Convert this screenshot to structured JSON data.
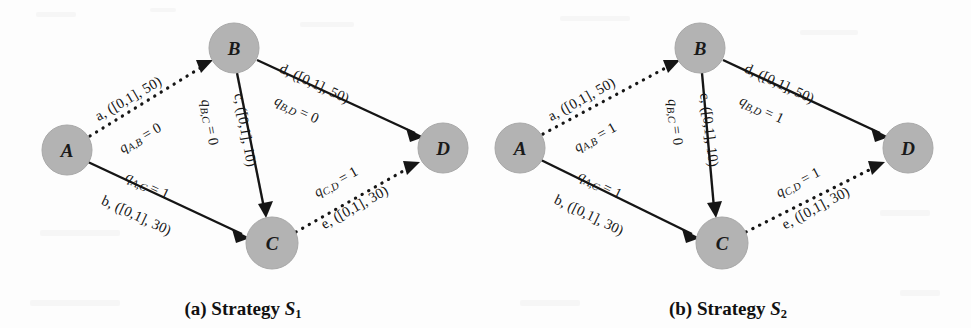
{
  "figure": {
    "type": "two-panel-directed-graph-figure",
    "node_fill_color": "#b3b3b3",
    "edge_color": "#151515",
    "background_color": "#fdfdfd"
  },
  "panels": [
    {
      "id": "panel-a",
      "caption_prefix": "(a)",
      "caption_word": "Strategy",
      "caption_symbol": "S",
      "caption_subscript": "1",
      "caption_full": "(a) Strategy S1",
      "nodes": [
        {
          "id": "A",
          "label": "A",
          "cx": 67,
          "cy": 150,
          "r": 25
        },
        {
          "id": "B",
          "label": "B",
          "cx": 234,
          "cy": 48,
          "r": 25
        },
        {
          "id": "C",
          "label": "C",
          "cx": 272,
          "cy": 243,
          "r": 26
        },
        {
          "id": "D",
          "label": "D",
          "cx": 443,
          "cy": 148,
          "r": 25
        }
      ],
      "edges": [
        {
          "id": "A-B",
          "from": "A",
          "to": "B",
          "style": "dotted",
          "edge_id": "a",
          "capacity_label": "a, ([0,1], 50)",
          "flow_var": "q",
          "flow_sub": "A,B",
          "flow_value": "0",
          "flow_label": "qA,B = 0"
        },
        {
          "id": "A-C",
          "from": "A",
          "to": "C",
          "style": "solid",
          "edge_id": "b",
          "capacity_label": "b, ([0,1], 30)",
          "flow_var": "q",
          "flow_sub": "A,C",
          "flow_value": "1",
          "flow_label": "qA,C = 1"
        },
        {
          "id": "B-C",
          "from": "B",
          "to": "C",
          "style": "solid",
          "edge_id": "c",
          "capacity_label": "c, ([0,1], 10)",
          "flow_var": "q",
          "flow_sub": "B,C",
          "flow_value": "0",
          "flow_label": "qB,C = 0"
        },
        {
          "id": "B-D",
          "from": "B",
          "to": "D",
          "style": "solid",
          "edge_id": "d",
          "capacity_label": "d, ([0,1], 50)",
          "flow_var": "q",
          "flow_sub": "B,D",
          "flow_value": "0",
          "flow_label": "qB,D = 0"
        },
        {
          "id": "C-D",
          "from": "C",
          "to": "D",
          "style": "dotted",
          "edge_id": "e",
          "capacity_label": "e, ([0,1], 30)",
          "flow_var": "q",
          "flow_sub": "C,D",
          "flow_value": "1",
          "flow_label": "qC,D = 1"
        }
      ]
    },
    {
      "id": "panel-b",
      "caption_prefix": "(b)",
      "caption_word": "Strategy",
      "caption_symbol": "S",
      "caption_subscript": "2",
      "caption_full": "(b) Strategy S2",
      "nodes": [
        {
          "id": "A",
          "label": "A",
          "cx": 35,
          "cy": 148,
          "r": 25
        },
        {
          "id": "B",
          "label": "B",
          "cx": 215,
          "cy": 48,
          "r": 25
        },
        {
          "id": "C",
          "label": "C",
          "cx": 237,
          "cy": 243,
          "r": 26
        },
        {
          "id": "D",
          "label": "D",
          "cx": 423,
          "cy": 148,
          "r": 25
        }
      ],
      "edges": [
        {
          "id": "A-B",
          "from": "A",
          "to": "B",
          "style": "dotted",
          "edge_id": "a",
          "capacity_label": "a, ([0,1], 50)",
          "flow_var": "q",
          "flow_sub": "A,B",
          "flow_value": "1",
          "flow_label": "qA,B = 1"
        },
        {
          "id": "A-C",
          "from": "A",
          "to": "C",
          "style": "solid",
          "edge_id": "b",
          "capacity_label": "b, ([0,1], 30)",
          "flow_var": "q",
          "flow_sub": "A,C",
          "flow_value": "1",
          "flow_label": "qA,C = 1"
        },
        {
          "id": "B-C",
          "from": "B",
          "to": "C",
          "style": "solid",
          "edge_id": "c",
          "capacity_label": "c, ([0,1], 10)",
          "flow_var": "q",
          "flow_sub": "B,C",
          "flow_value": "0",
          "flow_label": "qB,C = 0"
        },
        {
          "id": "B-D",
          "from": "B",
          "to": "D",
          "style": "solid",
          "edge_id": "d",
          "capacity_label": "d, ([0,1], 50)",
          "flow_var": "q",
          "flow_sub": "B,D",
          "flow_value": "1",
          "flow_label": "qB,D = 1"
        },
        {
          "id": "C-D",
          "from": "C",
          "to": "D",
          "style": "dotted",
          "edge_id": "e",
          "capacity_label": "e, ([0,1], 30)",
          "flow_var": "q",
          "flow_sub": "C,D",
          "flow_value": "1",
          "flow_label": "qC,D = 1"
        }
      ]
    }
  ]
}
